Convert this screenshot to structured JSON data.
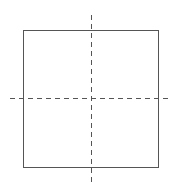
{
  "diagram": {
    "canvas": {
      "width": 179,
      "height": 192,
      "background": "#ffffff"
    },
    "square": {
      "x": 23,
      "y": 30,
      "width": 135,
      "height": 137,
      "stroke": "#555555",
      "stroke_width": 1
    },
    "vertical_axis": {
      "x": 91,
      "y1": 15,
      "y2": 183,
      "stroke": "#555555",
      "dash": "5,4"
    },
    "horizontal_axis": {
      "y": 98,
      "x1": 10,
      "x2": 172,
      "stroke": "#555555",
      "dash": "5,4"
    }
  }
}
